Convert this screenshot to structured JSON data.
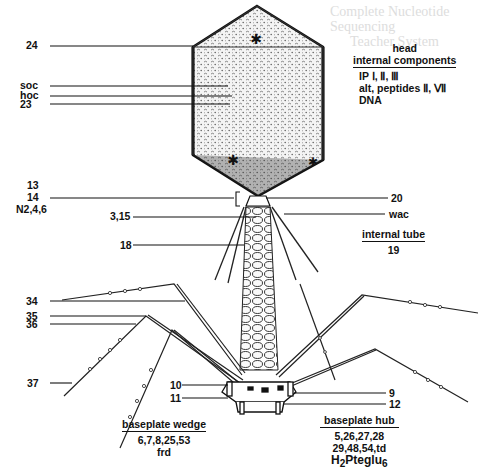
{
  "figure": {
    "ghost_text": [
      "Complete  Nucleotide Sequencing",
      "Teacher  System"
    ]
  },
  "labels_left": {
    "l24": "24",
    "soc": "soc",
    "hoc": "hoc",
    "l23": "23",
    "l13": "13",
    "l14": "14",
    "n246": "N2,4,6",
    "l315": "3,15",
    "l18": "18",
    "l34": "34",
    "l35": "35",
    "l36": "36",
    "l37": "37",
    "l10": "10",
    "l11": "11"
  },
  "labels_right": {
    "l20": "20",
    "wac": "wac",
    "l9": "9",
    "l12": "12"
  },
  "head_block": {
    "title1": "head",
    "title2": "internal components",
    "items": [
      "IP Ⅰ, Ⅱ, Ⅲ",
      "alt, peptides Ⅱ, Ⅶ",
      "DNA"
    ]
  },
  "internal_tube": {
    "title": "internal tube",
    "value": "19"
  },
  "baseplate_wedge": {
    "title": "baseplate wedge",
    "line1": "6,7,8,25,53",
    "line2": "frd"
  },
  "baseplate_hub": {
    "title": "baseplate  hub",
    "line1": "5,26,27,28",
    "line2": "29,48,54,td",
    "line3_main": "H",
    "line3_sub1": "2",
    "line3_mid": "Pteglu",
    "line3_sub2": "6"
  }
}
